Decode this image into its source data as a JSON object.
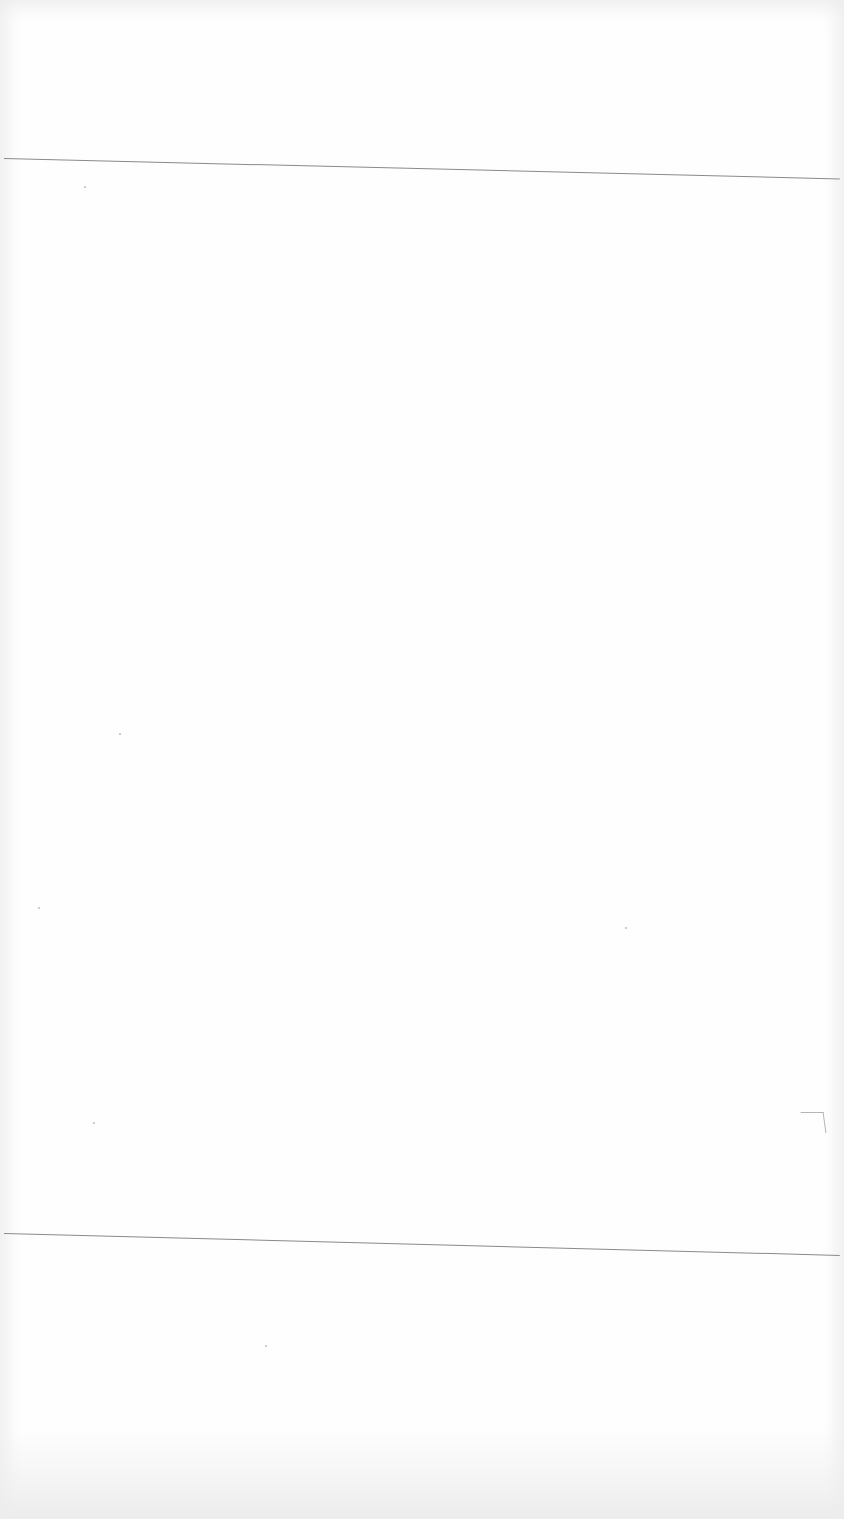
{
  "document": {
    "type": "blank scanned page",
    "text": "",
    "rules": [
      {
        "name": "top-rule",
        "y": 158
      },
      {
        "name": "bottom-rule",
        "y": 1233
      }
    ]
  }
}
